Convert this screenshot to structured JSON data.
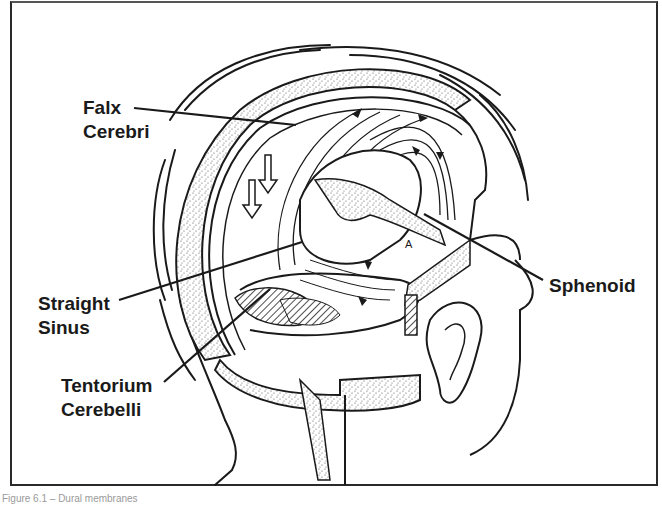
{
  "figure": {
    "caption": "Figure 6.1 – Dural membranes",
    "labels": {
      "falx_cerebri": "Falx\nCerebri",
      "straight_sinus": "Straight\nSinus",
      "tentorium_cerebelli": "Tentorium\nCerebelli",
      "sphenoid": "Sphenoid"
    },
    "small_marker": "A",
    "colors": {
      "ink": "#1a1a1a",
      "paper": "#ffffff",
      "stipple": "#8a8a8a"
    }
  }
}
